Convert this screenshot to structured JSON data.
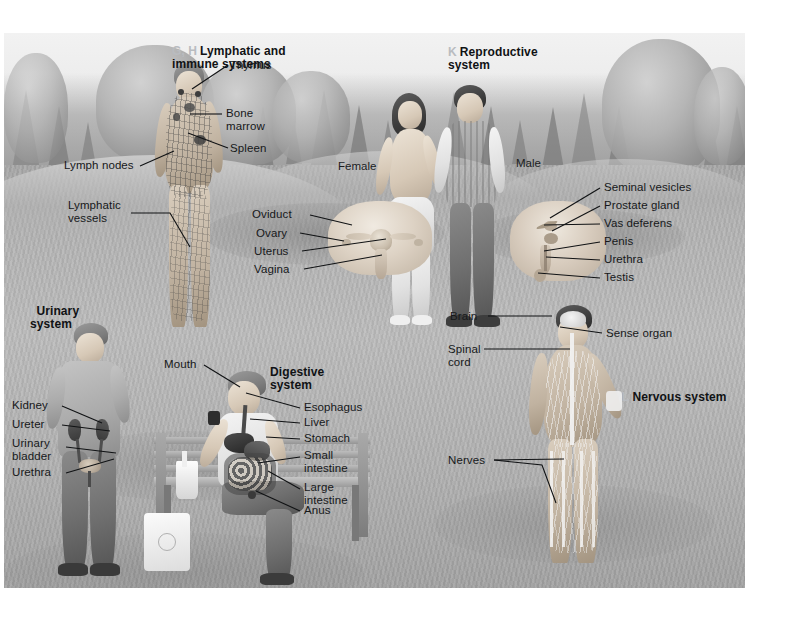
{
  "figure": {
    "type": "anatomical-illustration",
    "panels": [
      {
        "id": "lymphatic",
        "section_marker": "G, H",
        "title": "Lymphatic and\nimmune systems",
        "labels": [
          {
            "text": "Thymus"
          },
          {
            "text": "Bone\nmarrow"
          },
          {
            "text": "Spleen"
          },
          {
            "text": "Lymph nodes"
          },
          {
            "text": "Lymphatic\nvessels"
          }
        ]
      },
      {
        "id": "reproductive",
        "section_marker": "K",
        "title": "Reproductive\nsystem",
        "sublabels": [
          {
            "text": "Female"
          },
          {
            "text": "Male"
          }
        ],
        "labels": [
          {
            "text": "Oviduct"
          },
          {
            "text": "Ovary"
          },
          {
            "text": "Uterus"
          },
          {
            "text": "Vagina"
          },
          {
            "text": "Seminal vesicles"
          },
          {
            "text": "Prostate gland"
          },
          {
            "text": "Vas deferens"
          },
          {
            "text": "Penis"
          },
          {
            "text": "Urethra"
          },
          {
            "text": "Testis"
          }
        ]
      },
      {
        "id": "urinary",
        "section_marker": "I",
        "title": "Urinary\nsystem",
        "labels": [
          {
            "text": "Kidney"
          },
          {
            "text": "Ureter"
          },
          {
            "text": "Urinary\nbladder"
          },
          {
            "text": "Urethra"
          }
        ]
      },
      {
        "id": "digestive",
        "section_marker": "",
        "title": "Digestive\nsystem",
        "labels": [
          {
            "text": "Mouth"
          },
          {
            "text": "Esophagus"
          },
          {
            "text": "Liver"
          },
          {
            "text": "Stomach"
          },
          {
            "text": "Small\nintestine"
          },
          {
            "text": "Large\nintestine"
          },
          {
            "text": "Anus"
          }
        ]
      },
      {
        "id": "nervous",
        "section_marker": "L",
        "title": "Nervous system",
        "labels": [
          {
            "text": "Brain"
          },
          {
            "text": "Sense organ"
          },
          {
            "text": "Spinal\ncord"
          },
          {
            "text": "Nerves"
          }
        ]
      }
    ]
  },
  "lymphatic": {
    "marker": "G, H",
    "title": "Lymphatic and\nimmune systems",
    "thymus": "Thymus",
    "bone_marrow": "Bone\nmarrow",
    "spleen": "Spleen",
    "lymph_nodes": "Lymph nodes",
    "lymphatic_vessels": "Lymphatic\nvessels"
  },
  "reproductive": {
    "marker": "K",
    "title": "Reproductive\nsystem",
    "female": "Female",
    "male": "Male",
    "oviduct": "Oviduct",
    "ovary": "Ovary",
    "uterus": "Uterus",
    "vagina": "Vagina",
    "seminal_vesicles": "Seminal vesicles",
    "prostate_gland": "Prostate gland",
    "vas_deferens": "Vas deferens",
    "penis": "Penis",
    "urethra": "Urethra",
    "testis": "Testis"
  },
  "urinary": {
    "marker": "I",
    "title": "Urinary\nsystem",
    "kidney": "Kidney",
    "ureter": "Ureter",
    "urinary_bladder": "Urinary\nbladder",
    "urethra": "Urethra"
  },
  "digestive": {
    "title": "Digestive\nsystem",
    "mouth": "Mouth",
    "esophagus": "Esophagus",
    "liver": "Liver",
    "stomach": "Stomach",
    "small_intestine": "Small\nintestine",
    "large_intestine": "Large\nintestine",
    "anus": "Anus"
  },
  "nervous": {
    "marker": "L",
    "title": "Nervous system",
    "brain": "Brain",
    "sense_organ": "Sense organ",
    "spinal_cord": "Spinal\ncord",
    "nerves": "Nerves"
  },
  "colors": {
    "label_text": "#16181a",
    "marker_text": "#b9bcc0",
    "leader_line": "#101214",
    "plate_background": "#b9b9b9",
    "page_background": "#ffffff"
  }
}
